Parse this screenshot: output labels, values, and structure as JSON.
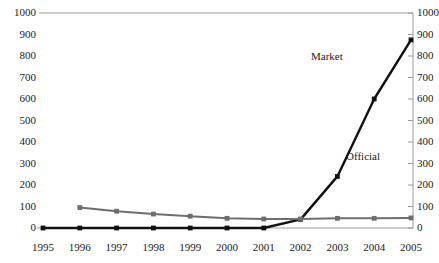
{
  "chart_data": {
    "type": "line",
    "title": "",
    "subtitle": "",
    "xlabel": "",
    "ylabel": "",
    "ylim": [
      0,
      1000
    ],
    "ytick_step": 100,
    "grid": false,
    "dual_axis": true,
    "legend_position": "inline-annotation",
    "x": [
      1995,
      1996,
      1997,
      1998,
      1999,
      2000,
      2001,
      2002,
      2003,
      2004,
      2005
    ],
    "xtick_labels": [
      "1995",
      "1996",
      "1997",
      "1998",
      "1999",
      "2000",
      "2001",
      "2002",
      "2003",
      "2004",
      "2005"
    ],
    "ytick_labels_left": [
      "1000",
      "900",
      "800",
      "700",
      "600",
      "500",
      "400",
      "300",
      "200",
      "100",
      "0"
    ],
    "ytick_labels_right": [
      "1000",
      "900",
      "800",
      "700",
      "600",
      "500",
      "400",
      "300",
      "200",
      "100",
      "0"
    ],
    "ytick_values": [
      1000,
      900,
      800,
      700,
      600,
      500,
      400,
      300,
      200,
      100,
      0
    ],
    "series": [
      {
        "name": "Market",
        "label": "Market",
        "color": "#111111",
        "line_width": 2.4,
        "marker": "square",
        "values": [
          0,
          0,
          0,
          0,
          0,
          0,
          0,
          40,
          240,
          600,
          875
        ]
      },
      {
        "name": "Official",
        "label": "Official",
        "color": "#6e6e6e",
        "line_width": 2.0,
        "marker": "square",
        "values": [
          null,
          95,
          78,
          65,
          55,
          45,
          42,
          42,
          45,
          45,
          47
        ]
      }
    ],
    "annotations": [
      {
        "text": "Market",
        "x_px": 311,
        "y_px": 50
      },
      {
        "text": "Official",
        "x_px": 346,
        "y_px": 150
      }
    ]
  },
  "colors": {
    "axis": "#9a9a9a",
    "baseline": "#111111",
    "text": "#1a1a1a",
    "background": "#ffffff",
    "series_market": "#111111",
    "series_official": "#6e6e6e"
  }
}
